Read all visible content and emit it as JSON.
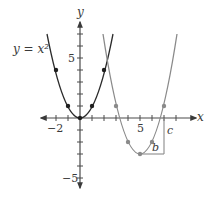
{
  "figure": {
    "curve_label": "y = x²",
    "axis_labels": {
      "x": "x",
      "y": "y"
    },
    "tick_labels": {
      "x_neg2": "−2",
      "x_5": "5",
      "y_5": "5",
      "y_neg5": "−5"
    },
    "bracket_labels": {
      "b": "b",
      "c": "c"
    },
    "colors": {
      "axis": "#4a4a4a",
      "base_curve": "#2b2b2b",
      "shifted_curve": "#8a8a8a",
      "bracket": "#8a8a8a"
    },
    "curves": [
      {
        "name": "y = x^2",
        "vertex": [
          0,
          0
        ],
        "points": [
          [
            -2,
            4
          ],
          [
            -1,
            1
          ],
          [
            0,
            0
          ],
          [
            1,
            1
          ],
          [
            2,
            4
          ]
        ]
      },
      {
        "name": "y = (x-5)^2 - 3",
        "vertex": [
          5,
          -3
        ],
        "points": [
          [
            3,
            1
          ],
          [
            4,
            -2
          ],
          [
            5,
            -3
          ],
          [
            6,
            -2
          ],
          [
            7,
            1
          ]
        ]
      }
    ],
    "axes": {
      "xlim": [
        -3,
        10
      ],
      "ylim": [
        -6,
        8
      ],
      "tick_step": 1
    }
  }
}
